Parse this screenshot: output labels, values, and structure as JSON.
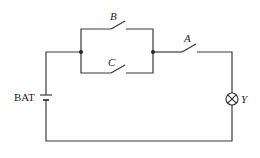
{
  "diagram": {
    "type": "circuit",
    "components": {
      "battery": {
        "label": "BAT"
      },
      "switch_a": {
        "label": "A"
      },
      "switch_b": {
        "label": "B"
      },
      "switch_c": {
        "label": "C"
      },
      "lamp": {
        "label": "Y"
      }
    },
    "topology": "BAT in series with (B parallel C) in series with A in series with lamp Y"
  }
}
